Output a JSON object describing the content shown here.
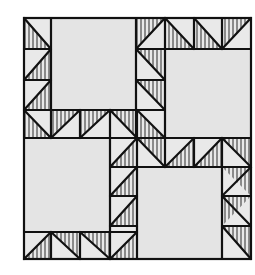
{
  "figure": {
    "title": "Quilt block pattern illustration",
    "colors": {
      "background": "#ffffff",
      "square_fill": "#e6e6e6",
      "triangle_fill": "#ebebeb",
      "line": "#111111",
      "hatch": "#444444"
    },
    "bounds": {
      "x0": 24,
      "y0": 18,
      "x1": 251,
      "y1": 259
    },
    "squares": [
      {
        "name": "top-left-square",
        "x": 51,
        "y": 18,
        "w": 85,
        "h": 92
      },
      {
        "name": "top-right-square",
        "x": 165,
        "y": 49,
        "w": 86,
        "h": 89
      },
      {
        "name": "bottom-left-square",
        "x": 24,
        "y": 138,
        "w": 86,
        "h": 94
      },
      {
        "name": "bottom-right-square",
        "x": 137,
        "y": 167,
        "w": 85,
        "h": 92
      }
    ]
  }
}
